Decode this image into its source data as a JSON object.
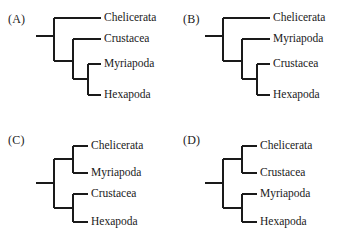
{
  "figure": {
    "background_color": "#ffffff",
    "line_color": "#1a1a1a",
    "line_width": 2,
    "panels": [
      {
        "caption": "(A)",
        "topology": "ladder",
        "tips": [
          {
            "label": "Chelicerata"
          },
          {
            "label": "Crustacea"
          },
          {
            "label": "Myriapoda"
          },
          {
            "label": "Hexapoda"
          }
        ]
      },
      {
        "caption": "(B)",
        "topology": "ladder",
        "tips": [
          {
            "label": "Chelicerata"
          },
          {
            "label": "Myriapoda"
          },
          {
            "label": "Crustacea"
          },
          {
            "label": "Hexapoda"
          }
        ]
      },
      {
        "caption": "(C)",
        "topology": "balanced",
        "tips": [
          {
            "label": "Chelicerata"
          },
          {
            "label": "Myriapoda"
          },
          {
            "label": "Crustacea"
          },
          {
            "label": "Hexapoda"
          }
        ]
      },
      {
        "caption": "(D)",
        "topology": "balanced",
        "tips": [
          {
            "label": "Chelicerata"
          },
          {
            "label": "Crustacea"
          },
          {
            "label": "Myriapoda"
          },
          {
            "label": "Hexapoda"
          }
        ]
      }
    ]
  }
}
